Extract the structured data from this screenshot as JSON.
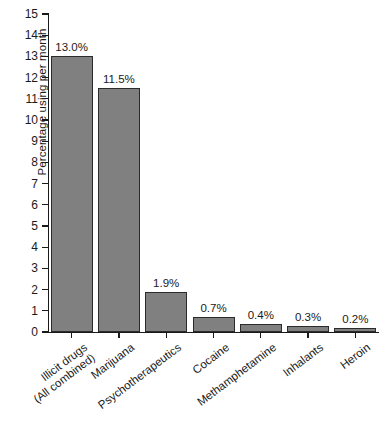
{
  "chart_data": {
    "type": "bar",
    "title": "",
    "xlabel": "",
    "ylabel": "Percentage using per month",
    "ylim": [
      0,
      15
    ],
    "ytick_step": 1,
    "grid": false,
    "legend": "none",
    "bar_color": "#808080",
    "bar_edge_color": "#2b2b2b",
    "categories": [
      "Illicit drugs (All combined)",
      "Marijuana",
      "Psychotherapeutics",
      "Cocaine",
      "Methamphetamine",
      "Inhalants",
      "Heroin"
    ],
    "category_lines": [
      [
        "Illicit drugs",
        "(All combined)"
      ],
      [
        "Marijuana",
        ""
      ],
      [
        "Psychotherapeutics",
        ""
      ],
      [
        "Cocaine",
        ""
      ],
      [
        "Methamphetamine",
        ""
      ],
      [
        "Inhalants",
        ""
      ],
      [
        "Heroin",
        ""
      ]
    ],
    "values": [
      13.0,
      11.5,
      1.9,
      0.7,
      0.4,
      0.3,
      0.2
    ],
    "value_labels": [
      "13.0%",
      "11.5%",
      "1.9%",
      "0.7%",
      "0.4%",
      "0.3%",
      "0.2%"
    ],
    "ytick_labels": [
      "15",
      "14",
      "13",
      "12",
      "11",
      "10",
      "9",
      "8",
      "7",
      "6",
      "5",
      "4",
      "3",
      "2",
      "1",
      "0"
    ]
  }
}
